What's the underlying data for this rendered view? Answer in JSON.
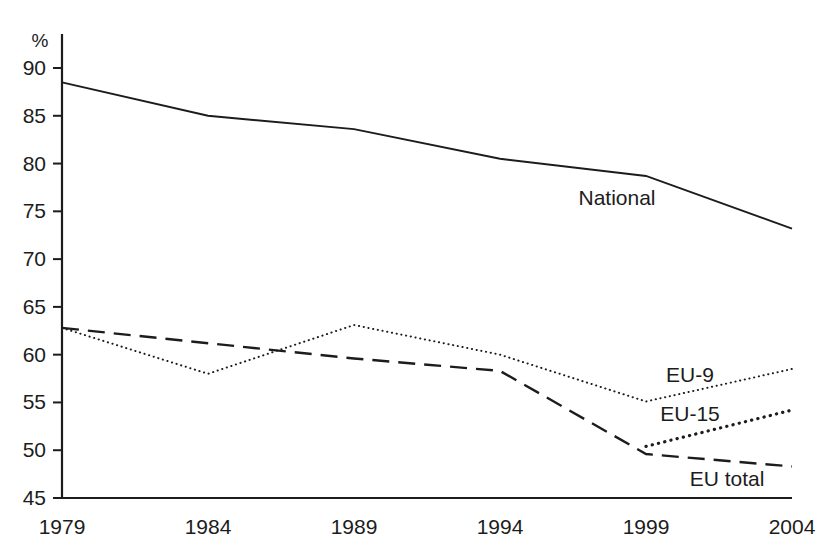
{
  "chart_data": {
    "type": "line",
    "title": "",
    "subtitle": "",
    "xlabel": "",
    "ylabel": "%",
    "y_unit_label": "%",
    "x": [
      1979,
      1984,
      1989,
      1994,
      1999,
      2004
    ],
    "categories": [
      "1979",
      "1984",
      "1989",
      "1994",
      "1999",
      "2004"
    ],
    "xlim": [
      1979,
      2004
    ],
    "ylim": [
      45,
      90
    ],
    "ytick_values": [
      45,
      50,
      55,
      60,
      65,
      70,
      75,
      80,
      85,
      90
    ],
    "ytick_labels": [
      "45",
      "50",
      "55",
      "60",
      "65",
      "70",
      "75",
      "80",
      "85",
      "90"
    ],
    "xtick_labels": [
      "1979",
      "1984",
      "1989",
      "1994",
      "1999",
      "2004"
    ],
    "grid": false,
    "legend_position": "inline-annotations",
    "series": [
      {
        "name": "National",
        "style": "solid",
        "label": "National",
        "x": [
          1979,
          1984,
          1989,
          1994,
          1999,
          2004
        ],
        "values": [
          88.5,
          85.0,
          83.6,
          80.5,
          78.7,
          73.2
        ]
      },
      {
        "name": "EU-9",
        "style": "fine-dotted",
        "label": "EU-9",
        "x": [
          1979,
          1984,
          1989,
          1994,
          1999,
          2004
        ],
        "values": [
          62.8,
          58.0,
          63.1,
          60.0,
          55.1,
          58.5
        ]
      },
      {
        "name": "EU-15",
        "style": "bold-dotted",
        "label": "EU-15",
        "x": [
          1999,
          2004
        ],
        "values": [
          50.4,
          54.2
        ]
      },
      {
        "name": "EU total",
        "style": "long-dashed",
        "label": "EU total",
        "x": [
          1979,
          1984,
          1989,
          1994,
          1999,
          2004
        ],
        "values": [
          62.8,
          61.2,
          59.6,
          58.3,
          49.6,
          48.3
        ]
      }
    ],
    "annotations": [
      {
        "text": "National",
        "series": "National",
        "x_px": 617,
        "y_px": 205
      },
      {
        "text": "EU-9",
        "series": "EU-9",
        "x_px": 690,
        "y_px": 382
      },
      {
        "text": "EU-15",
        "series": "EU-15",
        "x_px": 690,
        "y_px": 421
      },
      {
        "text": "EU total",
        "series": "EU total",
        "x_px": 727,
        "y_px": 486
      }
    ],
    "colors": {
      "line": "#1c1c1c",
      "axis": "#1c1c1c",
      "background": "#ffffff"
    }
  }
}
